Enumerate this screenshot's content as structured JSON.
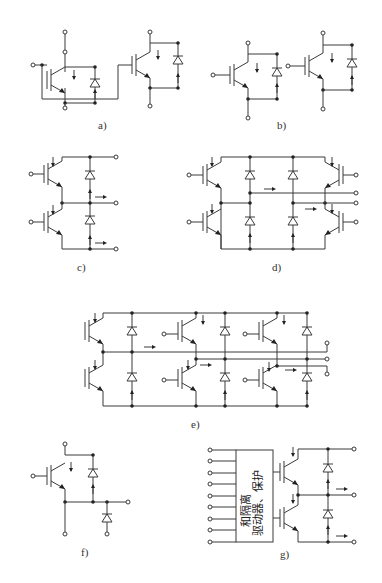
{
  "figure": {
    "panels": [
      {
        "id": "a",
        "label": "a)",
        "topology": "two IGBTs with anti-parallel diodes, common gate connection"
      },
      {
        "id": "b",
        "label": "b)",
        "topology": "two independent IGBTs with anti-parallel diodes"
      },
      {
        "id": "c",
        "label": "c)",
        "topology": "half-bridge (two IGBTs in series) with diodes"
      },
      {
        "id": "d",
        "label": "d)",
        "topology": "full H-bridge (four IGBTs) with diodes"
      },
      {
        "id": "e",
        "label": "e)",
        "topology": "three-phase bridge (six IGBTs) with diodes"
      },
      {
        "id": "f",
        "label": "f)",
        "topology": "chopper: IGBT with anti-parallel diode and free-wheeling diode"
      },
      {
        "id": "g",
        "label": "g)",
        "topology": "intelligent power module: driver block + half-bridge"
      }
    ],
    "driver_block": {
      "line1": "驱动器、保护",
      "line2": "和隔离"
    }
  }
}
